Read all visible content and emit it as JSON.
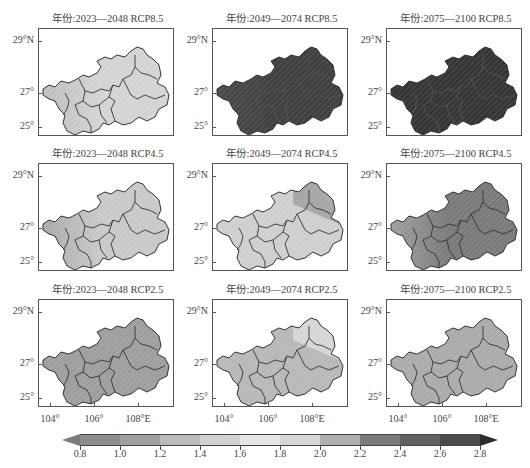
{
  "figure": {
    "rows": [
      {
        "scenario": "RCP8.5",
        "panels": [
          {
            "title": "年份:2023—2048  RCP8.5",
            "period": "2023—2048",
            "fill": "#d4d4d4",
            "fill_west": "#bdbdbd"
          },
          {
            "title": "年份:2049—2074  RCP8.5",
            "period": "2049—2074",
            "fill": "#3f3f3f",
            "fill_west": "#4a4a4a"
          },
          {
            "title": "年份:2075—2100  RCP8.5",
            "period": "2075—2100",
            "fill": "#353535",
            "fill_west": "#353535"
          }
        ]
      },
      {
        "scenario": "RCP4.5",
        "panels": [
          {
            "title": "年份:2023—2048  RCP4.5",
            "period": "2023—2048",
            "fill": "#c9c9c9",
            "fill_west": "#a9a9a9"
          },
          {
            "title": "年份:2049—2074  RCP4.5",
            "period": "2049—2074",
            "fill": "#cfcfcf",
            "fill_west": "#cfcfcf",
            "fill_ne": "#a6a6a6"
          },
          {
            "title": "年份:2075—2100  RCP4.5",
            "period": "2075—2100",
            "fill": "#7a7a7a",
            "fill_west": "#a0a0a0"
          }
        ]
      },
      {
        "scenario": "RCP2.5",
        "panels": [
          {
            "title": "年份:2023—2048  RCP2.5",
            "period": "2023—2048",
            "fill": "#9e9e9e",
            "fill_west": "#9e9e9e"
          },
          {
            "title": "年份:2049—2074  RCP2.5",
            "period": "2049—2074",
            "fill": "#b8b8b8",
            "fill_west": "#b8b8b8",
            "fill_ne": "#d6d6d6"
          },
          {
            "title": "年份:2075—2100  RCP2.5",
            "period": "2075—2100",
            "fill": "#ababab",
            "fill_west": "#ababab"
          }
        ]
      }
    ],
    "y_axis_labels": [
      "29°N",
      "27°",
      "25°"
    ],
    "x_axis_labels": [
      "104°",
      "106°",
      "108°E"
    ]
  },
  "colorbar": {
    "ticks": [
      "0.8",
      "1.0",
      "1.2",
      "1.4",
      "1.6",
      "1.8",
      "2.0",
      "2.2",
      "2.4",
      "2.6",
      "2.8"
    ],
    "colors": [
      "#8c8c8c",
      "#a0a0a0",
      "#bababa",
      "#d2d2d2",
      "#e6e6e6",
      "#d6d6d6",
      "#b0b0b0",
      "#7c7c7c",
      "#606060",
      "#4a4a4a",
      "#333333"
    ],
    "under_color": "#7c7c7c",
    "over_color": "#2c2c2c"
  },
  "chart_data": {
    "type": "heatmap",
    "xlabel": "Longitude",
    "ylabel": "Latitude",
    "x_ticks": [
      "104°",
      "106°",
      "108°E"
    ],
    "y_ticks": [
      "29°N",
      "27°",
      "25°"
    ],
    "xlim": [
      103.6,
      109.6
    ],
    "ylim": [
      24.6,
      29.3
    ],
    "colorbar": {
      "min": 0.8,
      "max": 2.8,
      "step": 0.2,
      "extend": "both"
    },
    "panels": [
      {
        "scenario": "RCP8.5",
        "period": "2023—2048",
        "approx_range": [
          1.2,
          1.6
        ]
      },
      {
        "scenario": "RCP8.5",
        "period": "2049—2074",
        "approx_range": [
          2.6,
          2.8
        ]
      },
      {
        "scenario": "RCP8.5",
        "period": "2075—2100",
        "approx_range": [
          2.8,
          3.0
        ]
      },
      {
        "scenario": "RCP4.5",
        "period": "2023—2048",
        "approx_range": [
          1.2,
          1.8
        ]
      },
      {
        "scenario": "RCP4.5",
        "period": "2049—2074",
        "approx_range": [
          1.2,
          1.6
        ]
      },
      {
        "scenario": "RCP4.5",
        "period": "2075—2100",
        "approx_range": [
          2.0,
          2.4
        ]
      },
      {
        "scenario": "RCP2.5",
        "period": "2023—2048",
        "approx_range": [
          2.0,
          2.2
        ]
      },
      {
        "scenario": "RCP2.5",
        "period": "2049—2074",
        "approx_range": [
          1.4,
          2.0
        ]
      },
      {
        "scenario": "RCP2.5",
        "period": "2075—2100",
        "approx_range": [
          1.8,
          2.0
        ]
      }
    ]
  }
}
